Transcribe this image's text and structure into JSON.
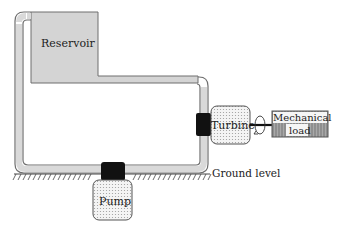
{
  "diagram": {
    "labels": {
      "reservoir": "Reservoir",
      "turbine": "Turbine",
      "mechanical_load_line1": "Mechanical",
      "mechanical_load_line2": "load",
      "pump": "Pump",
      "ground_level": "Ground level"
    },
    "colors": {
      "reservoir_fill": "#d4d4d4",
      "pipe_fill": "#d9d9d9",
      "pipe_stroke": "#6e6e6e",
      "valve_black": "#111111",
      "machine_fill": "#f1f1f1",
      "load_fill": "#8a8a8a",
      "ground_hatch": "#444444"
    },
    "icons": {
      "rotation": "rotation-arrow-icon",
      "shaft": "shaft-line"
    }
  }
}
